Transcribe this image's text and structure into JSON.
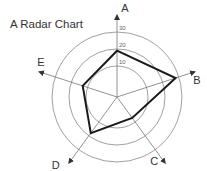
{
  "chart_data": {
    "type": "radar",
    "title": "A Radar Chart",
    "axes": [
      "A",
      "B",
      "C",
      "D",
      "E"
    ],
    "rings": [
      10,
      20,
      30
    ],
    "tick_labels": [
      "10",
      "20",
      "30"
    ],
    "series": [
      {
        "name": "series",
        "values": [
          19,
          28,
          7,
          18,
          13
        ]
      }
    ],
    "range": [
      0,
      30
    ],
    "grid": true,
    "legend": "none"
  },
  "colors": {
    "series_line": "#1a1a1a",
    "grid": "#888888",
    "text": "#333333"
  }
}
